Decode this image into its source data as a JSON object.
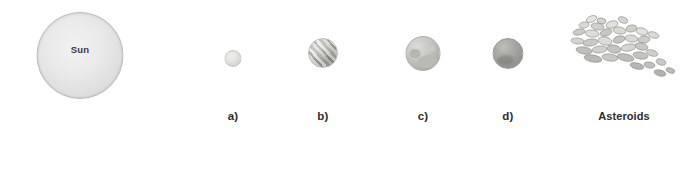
{
  "figure": {
    "background_color": "#ffffff",
    "width": 700,
    "height": 186
  },
  "sun": {
    "label": "Sun",
    "caption": "",
    "color": "#eaeaea",
    "relative_size": "largest"
  },
  "bodies": [
    {
      "id": "planet-a",
      "caption": "a)",
      "label": "",
      "color": "#e4e3df",
      "appearance": "small pale gray sphere",
      "relative_size": "smallest"
    },
    {
      "id": "planet-b",
      "caption": "b)",
      "label": "",
      "color": "#cfcfcb",
      "appearance": "banded sphere with diagonal light and dark stripes",
      "relative_size": "medium"
    },
    {
      "id": "planet-c",
      "caption": "c)",
      "label": "",
      "color": "#c6c6c3",
      "appearance": "gray sphere with darker mottled surface patches",
      "relative_size": "large"
    },
    {
      "id": "planet-d",
      "caption": "d)",
      "label": "",
      "color": "#a7a7a4",
      "appearance": "darker gray sphere",
      "relative_size": "medium-large"
    }
  ],
  "asteroids": {
    "caption": "Asteroids",
    "label": "",
    "color": "#c8c8c5",
    "outline_color": "#8a8a87",
    "appearance": "scattered cluster of irregular rock fragments trailing to lower right",
    "count": 34
  },
  "asteroid_rocks": [
    {
      "x": 16,
      "y": 2,
      "w": 11,
      "h": 6,
      "r": -22,
      "fill": "#e3e3e0"
    },
    {
      "x": 27,
      "y": 4,
      "w": 9,
      "h": 6,
      "r": 12,
      "fill": "#d2d2cf"
    },
    {
      "x": 9,
      "y": 8,
      "w": 10,
      "h": 6,
      "r": -8,
      "fill": "#d9d9d6"
    },
    {
      "x": 21,
      "y": 9,
      "w": 13,
      "h": 7,
      "r": 8,
      "fill": "#cfcfcc"
    },
    {
      "x": 36,
      "y": 7,
      "w": 12,
      "h": 7,
      "r": -15,
      "fill": "#e0e0dd"
    },
    {
      "x": 48,
      "y": 3,
      "w": 10,
      "h": 6,
      "r": 20,
      "fill": "#d5d5d2"
    },
    {
      "x": 3,
      "y": 15,
      "w": 12,
      "h": 6,
      "r": -12,
      "fill": "#cbcbc8"
    },
    {
      "x": 15,
      "y": 16,
      "w": 14,
      "h": 7,
      "r": 6,
      "fill": "#dddddA"
    },
    {
      "x": 30,
      "y": 15,
      "w": 12,
      "h": 7,
      "r": -18,
      "fill": "#c6c6c3"
    },
    {
      "x": 43,
      "y": 13,
      "w": 13,
      "h": 7,
      "r": 10,
      "fill": "#d8d8d5"
    },
    {
      "x": 56,
      "y": 11,
      "w": 11,
      "h": 7,
      "r": -10,
      "fill": "#cdcdca"
    },
    {
      "x": 66,
      "y": 14,
      "w": 12,
      "h": 7,
      "r": 15,
      "fill": "#e1e1de"
    },
    {
      "x": 1,
      "y": 24,
      "w": 13,
      "h": 6,
      "r": 5,
      "fill": "#d4d4d1"
    },
    {
      "x": 13,
      "y": 25,
      "w": 15,
      "h": 7,
      "r": -8,
      "fill": "#c9c9c6"
    },
    {
      "x": 28,
      "y": 23,
      "w": 14,
      "h": 8,
      "r": 12,
      "fill": "#dcdcd9"
    },
    {
      "x": 43,
      "y": 22,
      "w": 12,
      "h": 7,
      "r": -14,
      "fill": "#c4c4c1"
    },
    {
      "x": 55,
      "y": 21,
      "w": 13,
      "h": 7,
      "r": 8,
      "fill": "#d7d7d4"
    },
    {
      "x": 68,
      "y": 22,
      "w": 12,
      "h": 7,
      "r": -6,
      "fill": "#cbcbc8"
    },
    {
      "x": 78,
      "y": 18,
      "w": 11,
      "h": 6,
      "r": 18,
      "fill": "#dadad7"
    },
    {
      "x": 6,
      "y": 33,
      "w": 16,
      "h": 7,
      "r": 9,
      "fill": "#bfbfbc"
    },
    {
      "x": 22,
      "y": 32,
      "w": 15,
      "h": 7,
      "r": -5,
      "fill": "#d0d0cd"
    },
    {
      "x": 37,
      "y": 31,
      "w": 14,
      "h": 8,
      "r": 11,
      "fill": "#c3c3c0"
    },
    {
      "x": 51,
      "y": 30,
      "w": 15,
      "h": 7,
      "r": -9,
      "fill": "#d5d5d2"
    },
    {
      "x": 65,
      "y": 29,
      "w": 13,
      "h": 7,
      "r": 14,
      "fill": "#c7c7c4"
    },
    {
      "x": 14,
      "y": 41,
      "w": 18,
      "h": 7,
      "r": 10,
      "fill": "#b9b9b6"
    },
    {
      "x": 32,
      "y": 40,
      "w": 16,
      "h": 7,
      "r": 8,
      "fill": "#c8c8c5"
    },
    {
      "x": 47,
      "y": 40,
      "w": 17,
      "h": 7,
      "r": 12,
      "fill": "#bdbdba"
    },
    {
      "x": 63,
      "y": 38,
      "w": 15,
      "h": 7,
      "r": 9,
      "fill": "#c2c2bf"
    },
    {
      "x": 76,
      "y": 36,
      "w": 12,
      "h": 6,
      "r": 16,
      "fill": "#cecECB"
    },
    {
      "x": 60,
      "y": 49,
      "w": 14,
      "h": 6,
      "r": 13,
      "fill": "#b5b5b2"
    },
    {
      "x": 74,
      "y": 48,
      "w": 11,
      "h": 6,
      "r": 10,
      "fill": "#c0c0bd"
    },
    {
      "x": 86,
      "y": 45,
      "w": 10,
      "h": 6,
      "r": 18,
      "fill": "#cacac7"
    },
    {
      "x": 84,
      "y": 56,
      "w": 12,
      "h": 6,
      "r": 14,
      "fill": "#b2b2af"
    },
    {
      "x": 96,
      "y": 54,
      "w": 9,
      "h": 5,
      "r": 20,
      "fill": "#bcbcb9"
    }
  ]
}
